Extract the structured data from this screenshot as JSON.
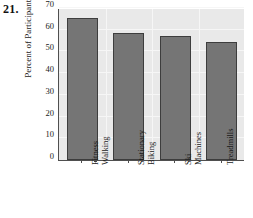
{
  "exercise": {
    "number": "21."
  },
  "chart_data": {
    "type": "bar",
    "title": "",
    "xlabel": "",
    "ylabel": "Percent of Participants",
    "categories": [
      "Fitness Walking",
      "Stationary Biking",
      "Ski Machines",
      "Treadmills"
    ],
    "category_lines": [
      [
        "Fitness",
        "Walking"
      ],
      [
        "Stationary",
        "Biking"
      ],
      [
        "Ski",
        "Machines"
      ],
      [
        "Treadmills"
      ]
    ],
    "values": [
      65.5,
      58.5,
      57,
      54.5
    ],
    "ylim": [
      0,
      70
    ],
    "yticks": [
      0,
      10,
      20,
      30,
      40,
      50,
      60,
      70
    ],
    "ytick_labels": [
      "0",
      "10",
      "20",
      "30",
      "40",
      "50",
      "60",
      "70"
    ],
    "grid": true,
    "legend": "none",
    "colors": {
      "bar_fill": "#757575",
      "bar_edge": "#3d3d3d",
      "plot_background": "#e9e9e9",
      "gridline": "#f6f6f6",
      "axis": "#4f4f4f",
      "text": "#1a1a1a"
    }
  }
}
